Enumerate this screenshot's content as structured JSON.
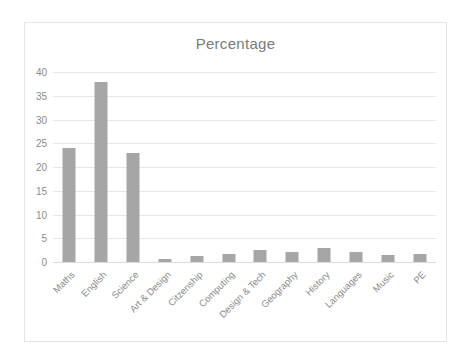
{
  "chart_data": {
    "type": "bar",
    "title": "Percentage",
    "xlabel": "",
    "ylabel": "",
    "ylim": [
      0,
      40
    ],
    "yticks": [
      0,
      5,
      10,
      15,
      20,
      25,
      30,
      35,
      40
    ],
    "grid": true,
    "legend": false,
    "bar_color": "#a6a6a6",
    "categories": [
      "Maths",
      "English",
      "Science",
      "Art & Design",
      "Citzenship",
      "Computing",
      "Design & Tech",
      "Geography",
      "History",
      "Languages",
      "Music",
      "PE"
    ],
    "values": [
      24,
      38,
      23,
      0.6,
      1.2,
      1.7,
      2.5,
      2.1,
      3.0,
      2.2,
      1.5,
      1.6
    ],
    "series": [
      {
        "name": "Percentage",
        "values": [
          24,
          38,
          23,
          0.6,
          1.2,
          1.7,
          2.5,
          2.1,
          3.0,
          2.2,
          1.5,
          1.6
        ]
      }
    ]
  },
  "frame": {
    "border_color": "#e4e4e4",
    "background": "#ffffff"
  }
}
